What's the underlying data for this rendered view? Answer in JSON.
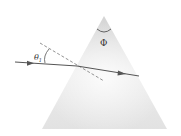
{
  "diagram": {
    "labels": {
      "incidence_angle": "θ",
      "incidence_angle_subscript": "1",
      "apex_angle": "Φ"
    },
    "colors": {
      "prism_top": "#d8d8d8",
      "prism_bottom": "#f2f2f2",
      "ray": "#555555",
      "normal": "#777777",
      "background": "#ffffff"
    },
    "elements": [
      {
        "id": "prism",
        "type": "triangle"
      },
      {
        "id": "incident-ray",
        "type": "arrow"
      },
      {
        "id": "refracted-ray",
        "type": "arrow"
      },
      {
        "id": "normal-line",
        "type": "dashed-line"
      },
      {
        "id": "incidence-angle-arc",
        "type": "arc"
      },
      {
        "id": "apex-angle-arc",
        "type": "arc"
      }
    ]
  }
}
